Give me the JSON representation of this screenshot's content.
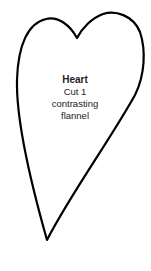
{
  "pattern": {
    "shape": "heart",
    "stroke_color": "#000000",
    "title": "Heart",
    "instructions": [
      "Cut 1",
      "contrasting",
      "flannel"
    ]
  }
}
